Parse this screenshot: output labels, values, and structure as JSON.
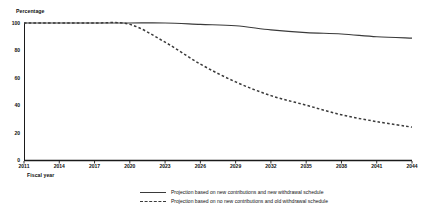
{
  "chart_data": {
    "type": "line",
    "title": "",
    "xlabel": "Fiscal year",
    "ylabel": "Percentage",
    "xlim": [
      2011,
      2044
    ],
    "ylim": [
      0,
      100
    ],
    "grid": false,
    "legend_position": "bottom",
    "x_ticks": [
      "2011",
      "2014",
      "2017",
      "2020",
      "2023",
      "2026",
      "2029",
      "2032",
      "2035",
      "2038",
      "2041",
      "2044"
    ],
    "y_ticks": [
      "0",
      "20",
      "40",
      "60",
      "80",
      "100"
    ],
    "series": [
      {
        "name": "Projection based on new contributions and new withdrawal schedule",
        "style": "solid",
        "color": "#3a3a3a",
        "x": [
          2011,
          2014,
          2017,
          2020,
          2023,
          2026,
          2029,
          2032,
          2035,
          2038,
          2041,
          2044
        ],
        "values": [
          100,
          100,
          100,
          100,
          100,
          99,
          98,
          95,
          93,
          92,
          90,
          89
        ]
      },
      {
        "name": "Projection based on no new contributions and old withdrawal schedule",
        "style": "dashed",
        "color": "#3a3a3a",
        "x": [
          2011,
          2014,
          2017,
          2020,
          2023,
          2026,
          2029,
          2032,
          2035,
          2038,
          2041,
          2044
        ],
        "values": [
          100,
          100,
          100,
          99,
          86,
          70,
          57,
          47,
          40,
          33,
          28,
          24
        ]
      }
    ]
  },
  "legend": {
    "items": [
      {
        "label": "Projection based on new contributions and new withdrawal schedule",
        "style": "solid"
      },
      {
        "label": "Projection based on no new contributions and old withdrawal schedule",
        "style": "dashed"
      }
    ]
  }
}
